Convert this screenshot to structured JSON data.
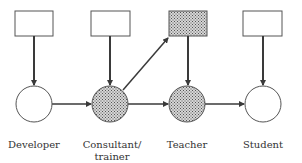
{
  "diagram": {
    "type": "flow",
    "colors": {
      "stroke": "#3a3a3a",
      "shade": "#9a9a9a",
      "background": "#ffffff"
    },
    "boxes": [
      {
        "id": "box-developer",
        "shaded": false
      },
      {
        "id": "box-consultant",
        "shaded": false
      },
      {
        "id": "box-teacher",
        "shaded": true
      },
      {
        "id": "box-student",
        "shaded": false
      }
    ],
    "nodes": [
      {
        "id": "developer",
        "label": "Developer",
        "shaded": false
      },
      {
        "id": "consultant",
        "label": "Consultant/",
        "label2": "trainer",
        "shaded": true
      },
      {
        "id": "teacher",
        "label": "Teacher",
        "shaded": true
      },
      {
        "id": "student",
        "label": "Student",
        "shaded": false
      }
    ],
    "edges": [
      {
        "from": "box-developer",
        "to": "developer"
      },
      {
        "from": "box-consultant",
        "to": "consultant"
      },
      {
        "from": "box-teacher",
        "to": "teacher"
      },
      {
        "from": "box-student",
        "to": "student"
      },
      {
        "from": "developer",
        "to": "consultant"
      },
      {
        "from": "consultant",
        "to": "teacher"
      },
      {
        "from": "teacher",
        "to": "student"
      },
      {
        "from": "consultant",
        "to": "box-teacher"
      }
    ]
  }
}
